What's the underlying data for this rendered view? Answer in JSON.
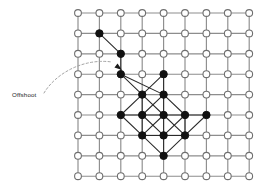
{
  "figure": {
    "background_color": "#ffffff",
    "width": 261,
    "height": 190
  },
  "annotation": {
    "label": "Offshoot",
    "label_x": 12,
    "label_y": 97,
    "leader_color": "#9a9a9a",
    "leader_style": "dashed-curve",
    "leader_path": "M 44 93 C 56 73, 84 58, 112 62",
    "arrow_tip_x": 122,
    "arrow_tip_y": 70,
    "arrow_from_x": 110,
    "arrow_from_y": 61,
    "points_to_node": "r3c2"
  },
  "lattice": {
    "rows": 9,
    "cols": 9,
    "origin_x": 78,
    "origin_y": 13,
    "spacing_x": 21.4,
    "spacing_y": 20.4,
    "line_color": "#8d8d8d",
    "node_radius": 3.4,
    "open_node_fill": "#ffffff",
    "open_node_stroke": "#6f6f6f",
    "filled_node_fill": "#111111",
    "edge_color": "#2a2a2a"
  },
  "chart_data": {
    "type": "scatter",
    "title": "Offshoot",
    "xlabel": "",
    "ylabel": "",
    "categories": [
      "open-site",
      "occupied-site"
    ],
    "grid": true,
    "legend": "none",
    "xlim": [
      0,
      8
    ],
    "ylim": [
      0,
      8
    ],
    "filled_nodes": [
      {
        "row": 1,
        "col": 1
      },
      {
        "row": 2,
        "col": 2
      },
      {
        "row": 3,
        "col": 2
      },
      {
        "row": 3,
        "col": 4
      },
      {
        "row": 4,
        "col": 3
      },
      {
        "row": 4,
        "col": 4
      },
      {
        "row": 5,
        "col": 2
      },
      {
        "row": 5,
        "col": 3
      },
      {
        "row": 5,
        "col": 4
      },
      {
        "row": 5,
        "col": 5
      },
      {
        "row": 5,
        "col": 6
      },
      {
        "row": 6,
        "col": 3
      },
      {
        "row": 6,
        "col": 4
      },
      {
        "row": 6,
        "col": 5
      },
      {
        "row": 7,
        "col": 4
      }
    ],
    "tree_edges": [
      {
        "from": {
          "row": 1,
          "col": 1
        },
        "to": {
          "row": 2,
          "col": 2
        }
      },
      {
        "from": {
          "row": 2,
          "col": 2
        },
        "to": {
          "row": 3,
          "col": 2
        }
      },
      {
        "from": {
          "row": 3,
          "col": 2
        },
        "to": {
          "row": 4,
          "col": 3
        }
      },
      {
        "from": {
          "row": 3,
          "col": 4
        },
        "to": {
          "row": 4,
          "col": 3
        }
      },
      {
        "from": {
          "row": 3,
          "col": 4
        },
        "to": {
          "row": 4,
          "col": 4
        }
      },
      {
        "from": {
          "row": 3,
          "col": 2
        },
        "to": {
          "row": 4,
          "col": 4
        }
      },
      {
        "from": {
          "row": 4,
          "col": 3
        },
        "to": {
          "row": 5,
          "col": 2
        }
      },
      {
        "from": {
          "row": 4,
          "col": 3
        },
        "to": {
          "row": 5,
          "col": 3
        }
      },
      {
        "from": {
          "row": 4,
          "col": 3
        },
        "to": {
          "row": 5,
          "col": 4
        }
      },
      {
        "from": {
          "row": 4,
          "col": 4
        },
        "to": {
          "row": 5,
          "col": 3
        }
      },
      {
        "from": {
          "row": 4,
          "col": 4
        },
        "to": {
          "row": 5,
          "col": 4
        }
      },
      {
        "from": {
          "row": 4,
          "col": 4
        },
        "to": {
          "row": 5,
          "col": 5
        }
      },
      {
        "from": {
          "row": 5,
          "col": 2
        },
        "to": {
          "row": 5,
          "col": 3
        }
      },
      {
        "from": {
          "row": 5,
          "col": 3
        },
        "to": {
          "row": 5,
          "col": 4
        }
      },
      {
        "from": {
          "row": 5,
          "col": 4
        },
        "to": {
          "row": 5,
          "col": 5
        }
      },
      {
        "from": {
          "row": 5,
          "col": 5
        },
        "to": {
          "row": 5,
          "col": 6
        }
      },
      {
        "from": {
          "row": 5,
          "col": 2
        },
        "to": {
          "row": 6,
          "col": 3
        }
      },
      {
        "from": {
          "row": 5,
          "col": 3
        },
        "to": {
          "row": 6,
          "col": 3
        }
      },
      {
        "from": {
          "row": 5,
          "col": 3
        },
        "to": {
          "row": 6,
          "col": 4
        }
      },
      {
        "from": {
          "row": 5,
          "col": 4
        },
        "to": {
          "row": 6,
          "col": 3
        }
      },
      {
        "from": {
          "row": 5,
          "col": 4
        },
        "to": {
          "row": 6,
          "col": 4
        }
      },
      {
        "from": {
          "row": 5,
          "col": 4
        },
        "to": {
          "row": 6,
          "col": 5
        }
      },
      {
        "from": {
          "row": 5,
          "col": 5
        },
        "to": {
          "row": 6,
          "col": 4
        }
      },
      {
        "from": {
          "row": 5,
          "col": 5
        },
        "to": {
          "row": 6,
          "col": 5
        }
      },
      {
        "from": {
          "row": 5,
          "col": 6
        },
        "to": {
          "row": 6,
          "col": 5
        }
      },
      {
        "from": {
          "row": 6,
          "col": 3
        },
        "to": {
          "row": 6,
          "col": 4
        }
      },
      {
        "from": {
          "row": 6,
          "col": 4
        },
        "to": {
          "row": 6,
          "col": 5
        }
      },
      {
        "from": {
          "row": 6,
          "col": 3
        },
        "to": {
          "row": 7,
          "col": 4
        }
      },
      {
        "from": {
          "row": 6,
          "col": 4
        },
        "to": {
          "row": 7,
          "col": 4
        }
      },
      {
        "from": {
          "row": 6,
          "col": 5
        },
        "to": {
          "row": 7,
          "col": 4
        }
      }
    ]
  }
}
